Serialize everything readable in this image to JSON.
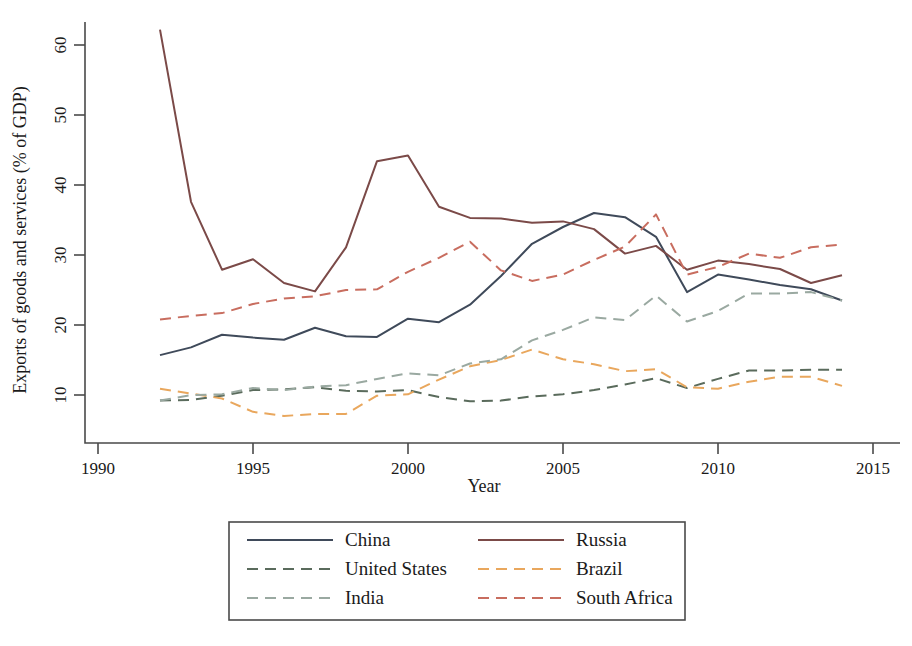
{
  "chart_data": {
    "type": "line",
    "title": "",
    "xlabel": "Year",
    "ylabel": "Exports of goods and services (% of GDP)",
    "xlim": [
      1990,
      2015
    ],
    "ylim": [
      5.5,
      64.5
    ],
    "xticks": [
      1990,
      1995,
      2000,
      2005,
      2010,
      2015
    ],
    "yticks": [
      10,
      20,
      30,
      40,
      50,
      60
    ],
    "grid": false,
    "legend_position": "below",
    "x": [
      1992,
      1993,
      1994,
      1995,
      1996,
      1997,
      1998,
      1999,
      2000,
      2001,
      2002,
      2003,
      2004,
      2005,
      2006,
      2007,
      2008,
      2009,
      2010,
      2011,
      2012,
      2013,
      2014
    ],
    "series": [
      {
        "name": "China",
        "color": "#3f4a5a",
        "style": "solid",
        "values": [
          15.7,
          16.8,
          18.6,
          18.2,
          17.9,
          19.6,
          18.4,
          18.3,
          20.9,
          20.4,
          22.9,
          27.0,
          31.6,
          34.0,
          36.0,
          35.4,
          32.6,
          24.7,
          27.2,
          26.5,
          25.7,
          25.1,
          23.5
        ]
      },
      {
        "name": "Russia",
        "color": "#7b4a48",
        "style": "solid",
        "values": [
          62.2,
          37.6,
          27.9,
          29.4,
          26.0,
          24.8,
          31.1,
          43.4,
          44.2,
          36.9,
          35.3,
          35.2,
          34.6,
          34.8,
          33.7,
          30.2,
          31.3,
          27.9,
          29.2,
          28.7,
          28.0,
          26.0,
          27.1
        ]
      },
      {
        "name": "United States",
        "color": "#5a6b5c",
        "style": "dashed",
        "values": [
          9.2,
          9.3,
          9.9,
          10.7,
          10.8,
          11.1,
          10.6,
          10.5,
          10.7,
          9.7,
          9.1,
          9.2,
          9.8,
          10.1,
          10.7,
          11.5,
          12.4,
          11.0,
          12.3,
          13.5,
          13.5,
          13.6,
          13.6
        ]
      },
      {
        "name": "Brazil",
        "color": "#e9a75d",
        "style": "dashed",
        "values": [
          10.9,
          10.2,
          9.5,
          7.6,
          7.0,
          7.3,
          7.3,
          9.9,
          10.1,
          12.2,
          14.1,
          15.0,
          16.5,
          15.1,
          14.4,
          13.4,
          13.7,
          11.1,
          10.9,
          11.9,
          12.6,
          12.6,
          11.3
        ]
      },
      {
        "name": "India",
        "color": "#9aa9a1",
        "style": "dashed",
        "values": [
          9.2,
          10.0,
          10.1,
          11.0,
          10.7,
          11.2,
          11.4,
          12.3,
          13.1,
          12.8,
          14.5,
          15.1,
          17.8,
          19.3,
          21.1,
          20.7,
          24.2,
          20.5,
          22.0,
          24.5,
          24.5,
          24.7,
          23.5
        ]
      },
      {
        "name": "South Africa",
        "color": "#c86d5f",
        "style": "dashed",
        "values": [
          20.8,
          21.3,
          21.7,
          23.0,
          23.8,
          24.1,
          25.0,
          25.1,
          27.6,
          29.6,
          31.9,
          27.8,
          26.3,
          27.2,
          29.3,
          31.2,
          35.8,
          27.2,
          28.3,
          30.2,
          29.6,
          31.1,
          31.5
        ]
      }
    ]
  },
  "axis": {
    "x_title": "Year",
    "y_title": "Exports of goods and services (% of GDP)",
    "x_tick_labels": [
      "1990",
      "1995",
      "2000",
      "2005",
      "2010",
      "2015"
    ],
    "y_tick_labels": [
      "10",
      "20",
      "30",
      "40",
      "50",
      "60"
    ]
  },
  "legend": {
    "entries": [
      {
        "label": "China",
        "color": "#3f4a5a",
        "style": "solid"
      },
      {
        "label": "Russia",
        "color": "#7b4a48",
        "style": "solid"
      },
      {
        "label": "United States",
        "color": "#5a6b5c",
        "style": "dashed"
      },
      {
        "label": "Brazil",
        "color": "#e9a75d",
        "style": "dashed"
      },
      {
        "label": "India",
        "color": "#9aa9a1",
        "style": "dashed"
      },
      {
        "label": "South Africa",
        "color": "#c86d5f",
        "style": "dashed"
      }
    ]
  }
}
